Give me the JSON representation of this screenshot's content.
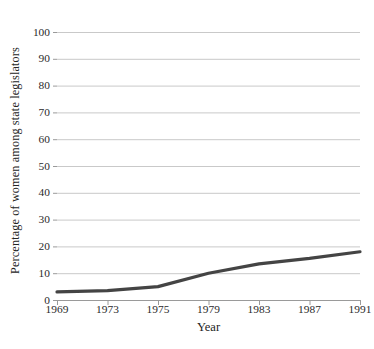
{
  "chart_data": {
    "type": "line",
    "title": "",
    "xlabel": "Year",
    "ylabel": "Percentage of women among state legislators",
    "categories": [
      "1969",
      "1973",
      "1975",
      "1979",
      "1983",
      "1987",
      "1991"
    ],
    "values": [
      3,
      3.5,
      5,
      10,
      13.5,
      15.5,
      18
    ],
    "series": [
      {
        "name": "Percentage of women among state legislators",
        "values": [
          3,
          3.5,
          5,
          10,
          13.5,
          15.5,
          18
        ],
        "color": "#444444"
      }
    ],
    "ylim": [
      0,
      100
    ],
    "yticks": [
      "0",
      "10",
      "20",
      "30",
      "40",
      "50",
      "60",
      "70",
      "80",
      "90",
      "100"
    ],
    "ytick_values": [
      0,
      10,
      20,
      30,
      40,
      50,
      60,
      70,
      80,
      90,
      100
    ],
    "xtick_labels": [
      "1969",
      "1973",
      "1975",
      "1979",
      "1983",
      "1987",
      "1991"
    ],
    "grid": "horizontal",
    "grid_color": "#c9c9c9",
    "legend": "none",
    "background": "#ffffff",
    "line_color": "#444444",
    "line_width": 3.2,
    "axis_color": "#9a9a9a"
  },
  "axes": {
    "y_title": "Percentage of women among state legislators",
    "x_title": "Year",
    "y_ticks": [
      {
        "label": "100",
        "value": 100
      },
      {
        "label": "90",
        "value": 90
      },
      {
        "label": "80",
        "value": 80
      },
      {
        "label": "70",
        "value": 70
      },
      {
        "label": "60",
        "value": 60
      },
      {
        "label": "50",
        "value": 50
      },
      {
        "label": "40",
        "value": 40
      },
      {
        "label": "30",
        "value": 30
      },
      {
        "label": "20",
        "value": 20
      },
      {
        "label": "10",
        "value": 10
      },
      {
        "label": "0",
        "value": 0
      }
    ],
    "x_ticks": [
      {
        "label": "1969"
      },
      {
        "label": "1973"
      },
      {
        "label": "1975"
      },
      {
        "label": "1979"
      },
      {
        "label": "1983"
      },
      {
        "label": "1987"
      },
      {
        "label": "1991"
      }
    ]
  }
}
